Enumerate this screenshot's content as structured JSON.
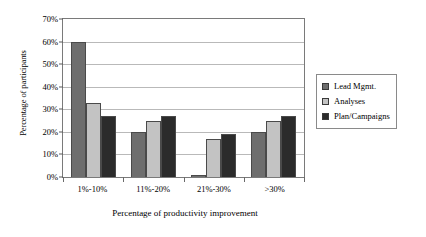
{
  "chart_data": {
    "type": "bar",
    "title": "",
    "xlabel": "Percentage of productivity improvement",
    "ylabel": "Percentage of participants",
    "categories": [
      "1%-10%",
      "11%-20%",
      "21%-30%",
      ">30%"
    ],
    "series": [
      {
        "name": "Lead Mgmt.",
        "color": "#6e6e6e",
        "values": [
          60,
          20,
          1,
          20
        ]
      },
      {
        "name": "Analyses",
        "color": "#c3c3c3",
        "values": [
          33,
          25,
          17,
          25
        ]
      },
      {
        "name": "Plan/Campaigns",
        "color": "#2b2b2b",
        "values": [
          27,
          27,
          19,
          27
        ]
      }
    ],
    "ylim": [
      0,
      70
    ],
    "yticks": [
      0,
      10,
      20,
      30,
      40,
      50,
      60,
      70
    ],
    "ytick_labels": [
      "0%",
      "10%",
      "20%",
      "30%",
      "40%",
      "50%",
      "60%",
      "70%"
    ],
    "grid": true,
    "legend_position": "right"
  }
}
